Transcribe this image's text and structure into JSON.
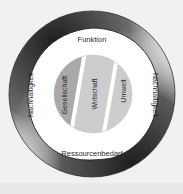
{
  "diagram": {
    "outer_ring": {
      "left_label": "Nachhaltigkeit",
      "right_label": "Nachhaltigkeit"
    },
    "inner_area": {
      "top_label": "Funktion",
      "bottom_label": "Ressourcenbedarf"
    },
    "core": {
      "bands": [
        {
          "label": "Gesellschaft",
          "color": "#a9a9a9"
        },
        {
          "label": "Wirtschaft",
          "color": "#cdcdcd"
        },
        {
          "label": "Umwelt",
          "color": "#cdcdcd"
        }
      ]
    },
    "colors": {
      "background": "#f1f1f1",
      "ring_dark": "#2e2e2e",
      "ring_light": "#ffffff",
      "separator": "#ffffff"
    }
  }
}
